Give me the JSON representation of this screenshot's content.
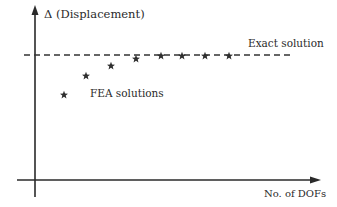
{
  "chart_data": {
    "type": "scatter",
    "title": "",
    "xlabel": "No. of DOFs",
    "ylabel": "Δ (Displacement)",
    "grid": false,
    "legend": "none",
    "annotations": [
      {
        "text": "Exact solution",
        "target": "reference line"
      },
      {
        "text": "FEA solutions",
        "target": "star markers"
      }
    ],
    "series": [
      {
        "name": "FEA solutions",
        "marker": "star",
        "x": [
          1,
          2,
          3,
          4,
          5,
          6,
          7,
          8
        ],
        "y": [
          0.62,
          0.78,
          0.86,
          0.92,
          0.95,
          0.96,
          0.96,
          0.96
        ]
      }
    ],
    "reference_lines": [
      {
        "name": "Exact solution",
        "y": 0.965,
        "style": "dashed"
      }
    ],
    "axis_ticks": "none",
    "note": "Qualitative convergence sketch; axes unlabeled numerically. y values normalized (exact solution approx 0.965)."
  },
  "labels": {
    "y_axis": "Δ (Displacement)",
    "x_axis": "No. of DOFs",
    "exact": "Exact solution",
    "fea": "FEA solutions"
  },
  "geometry": {
    "stars": [
      {
        "x": 64,
        "y": 95
      },
      {
        "x": 86,
        "y": 76
      },
      {
        "x": 111,
        "y": 66
      },
      {
        "x": 136,
        "y": 59
      },
      {
        "x": 161,
        "y": 56
      },
      {
        "x": 182,
        "y": 56
      },
      {
        "x": 205,
        "y": 56
      },
      {
        "x": 229,
        "y": 56
      }
    ],
    "dash_y": 55
  },
  "colors": {
    "ink": "#2a2a2a",
    "background": "#ffffff"
  }
}
